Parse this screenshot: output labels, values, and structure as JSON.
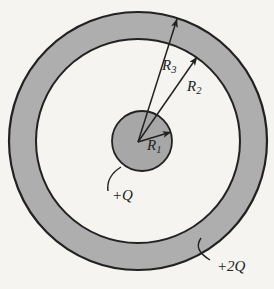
{
  "figure": {
    "type": "physics-concentric-spheres-diagram",
    "labels": {
      "r1": {
        "base": "R",
        "sub": "1"
      },
      "r2": {
        "base": "R",
        "sub": "2"
      },
      "r3": {
        "base": "R",
        "sub": "3"
      },
      "charge_inner_sphere": "+Q",
      "charge_outer_shell": "+2Q"
    },
    "colors": {
      "background": "#f5f4f1",
      "shell_fill": "#aeaeae",
      "sphere_fill": "#a7a7a7",
      "line": "#222222"
    }
  }
}
